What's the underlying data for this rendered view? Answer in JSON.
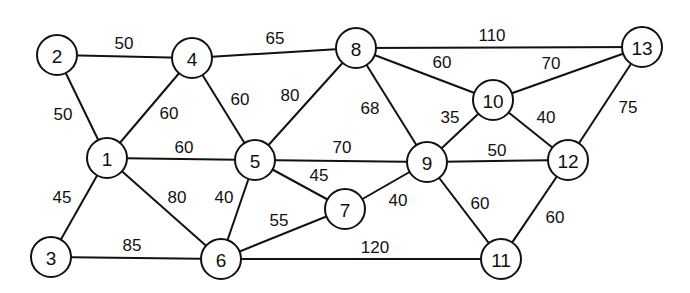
{
  "diagram": {
    "type": "weighted-undirected-graph",
    "style": {
      "line_color": "#111111",
      "node_fill": "#ffffff",
      "background": "#ffffff",
      "node_radius": 20
    },
    "nodes": [
      {
        "id": "1",
        "x": 107,
        "y": 158
      },
      {
        "id": "2",
        "x": 57,
        "y": 55
      },
      {
        "id": "3",
        "x": 51,
        "y": 257
      },
      {
        "id": "4",
        "x": 192,
        "y": 58
      },
      {
        "id": "5",
        "x": 255,
        "y": 160
      },
      {
        "id": "6",
        "x": 221,
        "y": 259
      },
      {
        "id": "7",
        "x": 345,
        "y": 209
      },
      {
        "id": "8",
        "x": 356,
        "y": 48
      },
      {
        "id": "9",
        "x": 427,
        "y": 162
      },
      {
        "id": "10",
        "x": 493,
        "y": 100
      },
      {
        "id": "11",
        "x": 501,
        "y": 259
      },
      {
        "id": "12",
        "x": 568,
        "y": 160
      },
      {
        "id": "13",
        "x": 642,
        "y": 47
      }
    ],
    "edges": [
      {
        "from": "2",
        "to": "4",
        "weight": "50",
        "lx": 124,
        "ly": 43
      },
      {
        "from": "4",
        "to": "8",
        "weight": "65",
        "lx": 275,
        "ly": 38
      },
      {
        "from": "8",
        "to": "13",
        "weight": "110",
        "lx": 492,
        "ly": 35
      },
      {
        "from": "2",
        "to": "1",
        "weight": "50",
        "lx": 63,
        "ly": 114
      },
      {
        "from": "4",
        "to": "1",
        "weight": "60",
        "lx": 169,
        "ly": 113
      },
      {
        "from": "4",
        "to": "5",
        "weight": "60",
        "lx": 240,
        "ly": 99
      },
      {
        "from": "8",
        "to": "5",
        "weight": "80",
        "lx": 290,
        "ly": 95
      },
      {
        "from": "8",
        "to": "10",
        "weight": "60",
        "lx": 442,
        "ly": 62
      },
      {
        "from": "10",
        "to": "13",
        "weight": "70",
        "lx": 551,
        "ly": 63
      },
      {
        "from": "8",
        "to": "9",
        "weight": "68",
        "lx": 370,
        "ly": 108
      },
      {
        "from": "10",
        "to": "9",
        "weight": "35",
        "lx": 450,
        "ly": 117
      },
      {
        "from": "10",
        "to": "12",
        "weight": "40",
        "lx": 546,
        "ly": 117
      },
      {
        "from": "13",
        "to": "12",
        "weight": "75",
        "lx": 628,
        "ly": 107
      },
      {
        "from": "1",
        "to": "5",
        "weight": "60",
        "lx": 184,
        "ly": 147
      },
      {
        "from": "5",
        "to": "9",
        "weight": "70",
        "lx": 342,
        "ly": 147
      },
      {
        "from": "9",
        "to": "12",
        "weight": "50",
        "lx": 497,
        "ly": 150
      },
      {
        "from": "5",
        "to": "7",
        "weight": "45",
        "lx": 319,
        "ly": 175
      },
      {
        "from": "1",
        "to": "3",
        "weight": "45",
        "lx": 62,
        "ly": 197
      },
      {
        "from": "1",
        "to": "6",
        "weight": "80",
        "lx": 177,
        "ly": 197
      },
      {
        "from": "5",
        "to": "6",
        "weight": "40",
        "lx": 224,
        "ly": 197
      },
      {
        "from": "7",
        "to": "9",
        "weight": "40",
        "lx": 398,
        "ly": 200
      },
      {
        "from": "9",
        "to": "11",
        "weight": "60",
        "lx": 480,
        "ly": 203
      },
      {
        "from": "12",
        "to": "11",
        "weight": "60",
        "lx": 555,
        "ly": 217
      },
      {
        "from": "6",
        "to": "7",
        "weight": "55",
        "lx": 279,
        "ly": 220
      },
      {
        "from": "3",
        "to": "6",
        "weight": "85",
        "lx": 132,
        "ly": 245
      },
      {
        "from": "6",
        "to": "11",
        "weight": "120",
        "lx": 375,
        "ly": 247
      }
    ]
  }
}
